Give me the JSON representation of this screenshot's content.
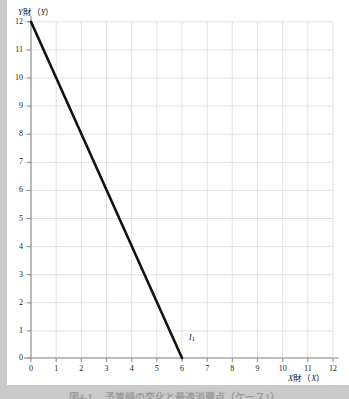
{
  "chart_data": {
    "type": "line",
    "title": "",
    "xlabel": "X財（X）",
    "ylabel": "Y財（Y）",
    "xlim": [
      0,
      12
    ],
    "ylim": [
      0,
      12
    ],
    "grid": true,
    "legend_position": "none",
    "x_ticks": [
      "0",
      "1",
      "2",
      "3",
      "4",
      "5",
      "6",
      "7",
      "8",
      "9",
      "10",
      "11",
      "12"
    ],
    "y_ticks": [
      "0",
      "1",
      "2",
      "3",
      "4",
      "5",
      "6",
      "7",
      "8",
      "9",
      "10",
      "11",
      "12"
    ],
    "series": [
      {
        "name": "I1",
        "label": "I",
        "label_subscript": "1",
        "label_x": 6.25,
        "label_y": 0.55,
        "color": "#111111",
        "line_width": 2.6,
        "x": [
          0,
          6
        ],
        "y": [
          12,
          0
        ],
        "equation": "Y = 12 - 2X",
        "x_intercept": 6,
        "y_intercept": 12,
        "slope": -2
      }
    ],
    "annotations": []
  },
  "axes": {
    "y_title": "Y財（Y）",
    "y_title_var_left": "Y",
    "y_title_middle": "財（",
    "y_title_var_right": "Y",
    "y_title_end": "）",
    "x_title": "X財（X）",
    "x_title_var_left": "X",
    "x_title_middle": "財（",
    "x_title_var_right": "X",
    "x_title_end": "）"
  },
  "caption": {
    "text": "図4-1　 予算線の変化と最適消費点（ケース1）"
  },
  "colors": {
    "page_background": "#c9c9c9",
    "card_background": "#ffffff",
    "grid": "#d9d9d9",
    "axis": "#8c8c8c",
    "line": "#111111",
    "text": "#1a1a1a"
  }
}
